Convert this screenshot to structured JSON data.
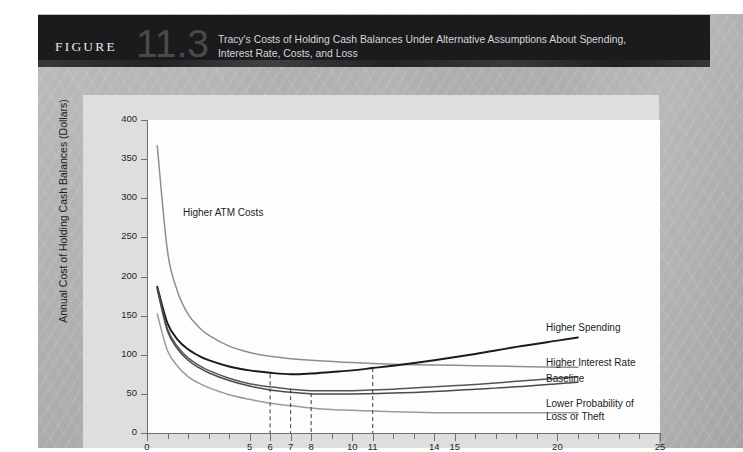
{
  "figure": {
    "word": "FIGURE",
    "number": "11.3",
    "title_line1": "Tracy's Costs of Holding Cash Balances Under Alternative Assumptions About Spending,",
    "title_line2": "Interest Rate, Costs, and Loss"
  },
  "colors": {
    "header_bg": "#1b1b1d",
    "plate_bg": "#dededf",
    "plot_bg": "#fdfdfd",
    "axis": "#6e6e6e",
    "baseline_curve": "#4a4a4a",
    "higher_spending_curve": "#1a1a1a",
    "higher_interest_rate_curve": "#555555",
    "higher_atm_costs_curve": "#8e8e8e",
    "lower_probability_curve": "#9a9a9a",
    "dashed_guide": "#3c3c3c"
  },
  "chart_data": {
    "type": "line",
    "title": "Tracy's Costs of Holding Cash Balances Under Alternative Assumptions About Spending, Interest Rate, Costs, and Loss",
    "xlabel": "",
    "ylabel": "Annual Cost of Holding Cash Balances (Dollars)",
    "xlim": [
      0,
      25
    ],
    "ylim": [
      0,
      400
    ],
    "grid": false,
    "legend_position": "inline-right",
    "yticks": [
      0,
      50,
      100,
      150,
      200,
      250,
      300,
      350,
      400
    ],
    "ytick_labels": [
      "0",
      "50",
      "100",
      "150",
      "200",
      "250",
      "300",
      "350",
      "400"
    ],
    "xticks": [
      0,
      5,
      6,
      7,
      8,
      10,
      11,
      14,
      15,
      20,
      25
    ],
    "xtick_labels": [
      "0",
      "5",
      "6",
      "7",
      "8",
      "10",
      "11",
      "14",
      "15",
      "20",
      "25"
    ],
    "xminor_step": 1,
    "optimum_markers": [
      {
        "x": 6,
        "label": "Higher ATM Costs minimum"
      },
      {
        "x": 7,
        "label": "Higher Spending minimum"
      },
      {
        "x": 8,
        "label": "Baseline minimum"
      },
      {
        "x": 11,
        "label": "Lower Probability of Loss or Theft minimum"
      }
    ],
    "series": [
      {
        "name": "Higher ATM Costs",
        "color": "#8e8e8e",
        "label_position": "upper-left",
        "x": [
          0.5,
          1,
          1.5,
          2,
          2.5,
          3,
          4,
          5,
          6,
          7,
          8,
          10,
          12,
          14,
          16,
          18,
          20,
          21
        ],
        "y": [
          367,
          232,
          180,
          152,
          136,
          125,
          111,
          103,
          98,
          95,
          93,
          90,
          88,
          87,
          86,
          85,
          84,
          84
        ]
      },
      {
        "name": "Higher Spending",
        "color": "#1a1a1a",
        "label_position": "right",
        "x": [
          0.5,
          1,
          1.5,
          2,
          2.5,
          3,
          4,
          5,
          6,
          7,
          8,
          9,
          10,
          11,
          12,
          14,
          16,
          18,
          20,
          21
        ],
        "y": [
          187,
          140,
          119,
          107,
          99,
          93,
          85,
          80,
          77,
          75,
          76,
          78,
          80,
          83,
          86,
          93,
          101,
          110,
          118,
          122
        ]
      },
      {
        "name": "Higher Interest Rate",
        "color": "#555555",
        "label_position": "right",
        "x": [
          0.5,
          1,
          1.5,
          2,
          2.5,
          3,
          4,
          5,
          6,
          7,
          8,
          9,
          10,
          12,
          14,
          16,
          18,
          20,
          21
        ],
        "y": [
          185,
          133,
          110,
          96,
          87,
          80,
          70,
          63,
          59,
          56,
          54,
          54,
          54,
          56,
          59,
          62,
          66,
          70,
          72
        ]
      },
      {
        "name": "Baseline",
        "color": "#4a4a4a",
        "label_position": "right",
        "x": [
          0.5,
          1,
          1.5,
          2,
          2.5,
          3,
          4,
          5,
          6,
          7,
          8,
          9,
          10,
          12,
          14,
          16,
          18,
          20,
          21
        ],
        "y": [
          184,
          130,
          107,
          93,
          84,
          77,
          67,
          60,
          55,
          52,
          50,
          50,
          50,
          51,
          53,
          56,
          59,
          63,
          65
        ]
      },
      {
        "name": "Lower Probability of Loss or Theft",
        "color": "#9a9a9a",
        "label_position": "right",
        "x": [
          0.5,
          1,
          1.5,
          2,
          2.5,
          3,
          4,
          5,
          6,
          7,
          8,
          9,
          10,
          11,
          12,
          14,
          16,
          18,
          20,
          21
        ],
        "y": [
          152,
          105,
          85,
          72,
          64,
          58,
          49,
          43,
          38,
          35,
          32,
          30,
          29,
          28,
          27,
          26,
          26,
          26,
          26,
          26
        ]
      }
    ]
  }
}
